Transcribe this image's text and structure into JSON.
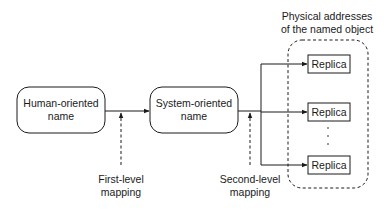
{
  "diagram": {
    "nodes": {
      "human": {
        "line1": "Human-oriented",
        "line2": "name"
      },
      "system": {
        "line1": "System-oriented",
        "line2": "name"
      }
    },
    "mappings": {
      "first": {
        "line1": "First-level",
        "line2": "mapping"
      },
      "second": {
        "line1": "Second-level",
        "line2": "mapping"
      }
    },
    "group": {
      "title_line1": "Physical addresses",
      "title_line2": "of the named object",
      "replicas": [
        {
          "label": "Replica"
        },
        {
          "label": "Replica"
        },
        {
          "label": "Replica"
        }
      ],
      "ellipsis": "·"
    },
    "colors": {
      "stroke": "#1a1a1a",
      "background": "#ffffff"
    }
  }
}
